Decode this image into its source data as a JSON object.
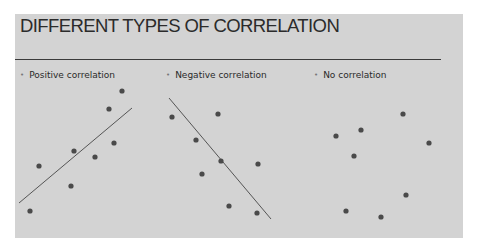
{
  "slide": {
    "title": "DIFFERENT TYPES OF CORRELATION",
    "background": "#d3d3d3",
    "bullets": [
      {
        "label": "Positive correlation",
        "bullet": "•"
      },
      {
        "label": "Negative correlation",
        "bullet": "•"
      },
      {
        "label": "No correlation",
        "bullet": "•"
      }
    ]
  },
  "chart_data": [
    {
      "type": "scatter",
      "title": "Positive correlation",
      "points_px": [
        [
          122,
          91
        ],
        [
          109,
          109
        ],
        [
          114,
          143
        ],
        [
          74,
          151
        ],
        [
          95,
          157
        ],
        [
          39,
          166
        ],
        [
          71,
          186
        ],
        [
          30,
          211
        ]
      ],
      "trend_line_px": [
        [
          19,
          203
        ],
        [
          132,
          108
        ]
      ]
    },
    {
      "type": "scatter",
      "title": "Negative correlation",
      "points_px": [
        [
          172,
          117
        ],
        [
          218,
          114
        ],
        [
          196,
          140
        ],
        [
          221,
          161
        ],
        [
          258,
          164
        ],
        [
          202,
          174
        ],
        [
          229,
          206
        ],
        [
          257,
          213
        ]
      ],
      "trend_line_px": [
        [
          169,
          98
        ],
        [
          271,
          219
        ]
      ]
    },
    {
      "type": "scatter",
      "title": "No correlation",
      "points_px": [
        [
          403,
          114
        ],
        [
          361,
          130
        ],
        [
          336,
          136
        ],
        [
          429,
          143
        ],
        [
          354,
          156
        ],
        [
          406,
          195
        ],
        [
          346,
          211
        ],
        [
          381,
          217
        ]
      ],
      "trend_line_px": null
    }
  ]
}
